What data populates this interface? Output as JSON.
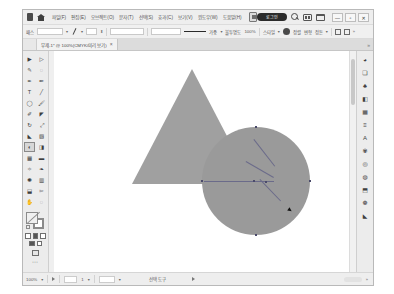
{
  "app": {
    "name": "Adobe Illustrator",
    "logo_icon": "illustrator-logo-icon",
    "home_icon": "home-icon"
  },
  "menubar": {
    "items": [
      {
        "label": "파일(F)",
        "name": "menu-file"
      },
      {
        "label": "편집(E)",
        "name": "menu-edit"
      },
      {
        "label": "오브젝트(O)",
        "name": "menu-object"
      },
      {
        "label": "문자(T)",
        "name": "menu-type"
      },
      {
        "label": "선택(S)",
        "name": "menu-select"
      },
      {
        "label": "효과(C)",
        "name": "menu-effect"
      },
      {
        "label": "보기(V)",
        "name": "menu-view"
      },
      {
        "label": "윈도우(W)",
        "name": "menu-window"
      },
      {
        "label": "도움말(H)",
        "name": "menu-help"
      }
    ],
    "account_badge": "로그인",
    "search_icon": "search-icon",
    "workspace_icon": "workspace-switcher-icon",
    "arrange_icon": "arrange-documents-icon",
    "window_buttons": [
      {
        "glyph": "—",
        "name": "minimize-button"
      },
      {
        "glyph": "▫",
        "name": "maximize-button"
      },
      {
        "glyph": "✕",
        "name": "close-button"
      }
    ]
  },
  "controlbar": {
    "selection_label": "패스",
    "no_selection": "선택 없음",
    "stroke_weight_label": "가중",
    "stroke_weight_value": "1 pt",
    "opacity_label": "불투명도",
    "opacity_value": "100%",
    "style_label": "스타일",
    "align_label": "정렬",
    "transform_label": "변형",
    "arrange_label": "정돈",
    "fill_icon": "fill-swatch-icon",
    "stroke_icon": "stroke-swatch-icon",
    "pen_icon": "pen-tool-icon",
    "doc_setup_label": "문서 설정"
  },
  "tabbar": {
    "document_title": "무제-1* @ 100%(CMYK/미리 보기)",
    "close_glyph": "×"
  },
  "tools": {
    "items": [
      {
        "name": "selection-tool",
        "glyph": "▶",
        "selected": false
      },
      {
        "name": "direct-selection-tool",
        "glyph": "▷",
        "selected": false
      },
      {
        "name": "magic-wand-tool",
        "glyph": "✎",
        "selected": false
      },
      {
        "name": "lasso-tool",
        "glyph": "◌",
        "selected": false
      },
      {
        "name": "pen-tool",
        "glyph": "✒",
        "selected": false
      },
      {
        "name": "curvature-tool",
        "glyph": "✏",
        "selected": false
      },
      {
        "name": "type-tool",
        "glyph": "T",
        "selected": false
      },
      {
        "name": "line-segment-tool",
        "glyph": "╱",
        "selected": false
      },
      {
        "name": "ellipse-tool",
        "glyph": "◯",
        "selected": false
      },
      {
        "name": "paintbrush-tool",
        "glyph": "🖌",
        "selected": false
      },
      {
        "name": "pencil-tool",
        "glyph": "✐",
        "selected": false
      },
      {
        "name": "eraser-tool",
        "glyph": "◤",
        "selected": false
      },
      {
        "name": "rotate-tool",
        "glyph": "↻",
        "selected": false
      },
      {
        "name": "scale-tool",
        "glyph": "⤢",
        "selected": false
      },
      {
        "name": "width-tool",
        "glyph": "◣",
        "selected": false
      },
      {
        "name": "free-transform-tool",
        "glyph": "▧",
        "selected": false
      },
      {
        "name": "shape-builder-tool",
        "glyph": "◐",
        "selected": true
      },
      {
        "name": "perspective-grid-tool",
        "glyph": "◨",
        "selected": false
      },
      {
        "name": "mesh-tool",
        "glyph": "▦",
        "selected": false
      },
      {
        "name": "gradient-tool",
        "glyph": "▬",
        "selected": false
      },
      {
        "name": "eyedropper-tool",
        "glyph": "✧",
        "selected": false
      },
      {
        "name": "blend-tool",
        "glyph": "❧",
        "selected": false
      },
      {
        "name": "symbol-sprayer-tool",
        "glyph": "✺",
        "selected": false
      },
      {
        "name": "column-graph-tool",
        "glyph": "▥",
        "selected": false
      },
      {
        "name": "artboard-tool",
        "glyph": "⬓",
        "selected": false
      },
      {
        "name": "slice-tool",
        "glyph": "✂",
        "selected": false
      },
      {
        "name": "hand-tool",
        "glyph": "✋",
        "selected": false
      },
      {
        "name": "zoom-tool",
        "glyph": "◌",
        "selected": false
      }
    ],
    "fill_label": "칠",
    "stroke_label": "획",
    "color_modes": [
      {
        "name": "color-mode-button",
        "glyph": ""
      },
      {
        "name": "gradient-mode-button",
        "glyph": ""
      },
      {
        "name": "none-mode-button",
        "glyph": ""
      }
    ],
    "screen_mode_name": "screen-mode-button",
    "more_tools_glyph": "⋯"
  },
  "canvas": {
    "artboard_background": "#ffffff",
    "shapes": [
      {
        "name": "triangle-shape",
        "type": "triangle",
        "fill": "#a0a0a0",
        "selected": false,
        "left": 78,
        "top": 18,
        "width": 120,
        "height": 115
      },
      {
        "name": "circle-shape",
        "type": "circle",
        "fill": "#9a9a9a",
        "selected": true,
        "left": 148,
        "top": 76,
        "diameter": 108
      }
    ],
    "guides": [
      {
        "name": "shape-builder-guide-1",
        "left": 212,
        "top": 130,
        "length": 58,
        "angle": -56
      },
      {
        "name": "shape-builder-guide-2",
        "left": 198,
        "top": 144,
        "length": 36,
        "angle": -36
      },
      {
        "name": "shape-builder-guide-3",
        "left": 150,
        "top": 130,
        "length": 70,
        "angle": 0
      }
    ],
    "cursor": {
      "name": "shape-builder-cursor",
      "left": 219,
      "top": 161
    },
    "scrollbar_name": "vertical-scrollbar"
  },
  "dock": {
    "panels": [
      {
        "name": "panel-properties-icon",
        "glyph": "◕"
      },
      {
        "name": "panel-layers-icon",
        "glyph": "❏"
      },
      {
        "name": "panel-libraries-icon",
        "glyph": "♣"
      },
      {
        "name": "panel-color-icon",
        "glyph": "◧"
      },
      {
        "name": "panel-swatches-icon",
        "glyph": "▦"
      },
      {
        "name": "panel-stroke-icon",
        "glyph": "≡"
      },
      {
        "name": "panel-character-icon",
        "glyph": "A"
      },
      {
        "name": "panel-brushes-icon",
        "glyph": "✾"
      },
      {
        "name": "panel-symbols-icon",
        "glyph": "◎"
      },
      {
        "name": "panel-appearance-icon",
        "glyph": "◍"
      },
      {
        "name": "panel-transform-icon",
        "glyph": "⬒"
      },
      {
        "name": "panel-pathfinder-icon",
        "glyph": "❁"
      },
      {
        "name": "panel-gradient-icon",
        "glyph": "◣"
      }
    ]
  },
  "statusbar": {
    "zoom_value": "100%",
    "artboard_value": "1",
    "nav_value": "1",
    "status_text": "선택 도구",
    "prev_glyph": "◀",
    "next_glyph": "▶"
  }
}
